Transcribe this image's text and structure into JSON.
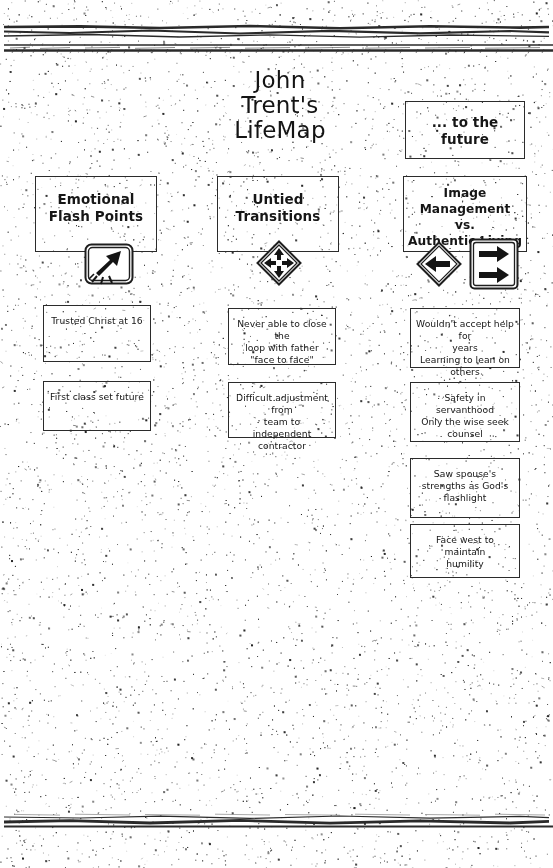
{
  "document": {
    "title_lines": [
      "John",
      "Trent's",
      "LifeMap"
    ]
  },
  "future": {
    "label": "... to the\nfuture"
  },
  "columns": [
    {
      "header": "Emotional\nFlash Points",
      "icon": "rocket-icon",
      "notes": [
        "Trusted Christ at 16",
        "First class set future"
      ]
    },
    {
      "header": "Untied\nTransitions",
      "icon": "four-way-arrow-icon",
      "notes": [
        "Never able to close the\nloop  with father\n\"face to face\"",
        "Difficult adjustment from\nteam to independent\ncontractor"
      ]
    },
    {
      "header": "Image Management\nvs.\nAuthentic Living",
      "icon": "left-arrow-diamond-icon",
      "icon2": "double-right-arrow-icon",
      "notes": [
        "Wouldn't accept help for\nyears\nLearning to lean on\nothers",
        "Safety in servanthood\nOnly the wise seek\ncounsel",
        "Saw spouse's\nstrengths as God's\nflashlight",
        "Face west to maintain\nhumility"
      ]
    }
  ],
  "colors": {
    "ink": "#1a1a1a",
    "border": "#2b2b2b",
    "paper": "#ffffff"
  }
}
